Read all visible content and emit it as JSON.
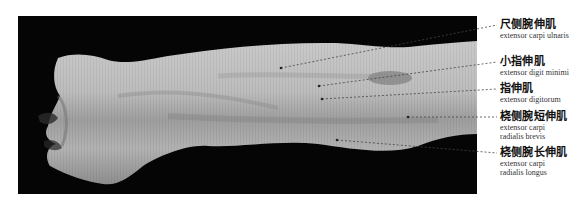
{
  "figure": {
    "leader_color": "#444444",
    "labels": [
      {
        "zh": "尺侧腕伸肌",
        "en": [
          "extensor carpi ulnaris"
        ],
        "top": 18,
        "point": [
          281,
          68
        ],
        "anchor": [
          497,
          25
        ]
      },
      {
        "zh": "小指伸肌",
        "en": [
          "extensor digit minimi"
        ],
        "top": 55,
        "point": [
          319,
          86
        ],
        "anchor": [
          497,
          62
        ]
      },
      {
        "zh": "指伸肌",
        "en": [
          "extensor digitorum"
        ],
        "top": 82,
        "point": [
          322,
          99
        ],
        "anchor": [
          497,
          89
        ]
      },
      {
        "zh": "桡侧腕短伸肌",
        "en": [
          "extensor carpi",
          "radialis brevis"
        ],
        "top": 110,
        "point": [
          408,
          117
        ],
        "anchor": [
          497,
          117
        ]
      },
      {
        "zh": "桡侧腕长伸肌",
        "en": [
          "extensor carpi",
          "radialis longus"
        ],
        "top": 146,
        "point": [
          337,
          140
        ],
        "anchor": [
          497,
          153
        ]
      }
    ]
  }
}
